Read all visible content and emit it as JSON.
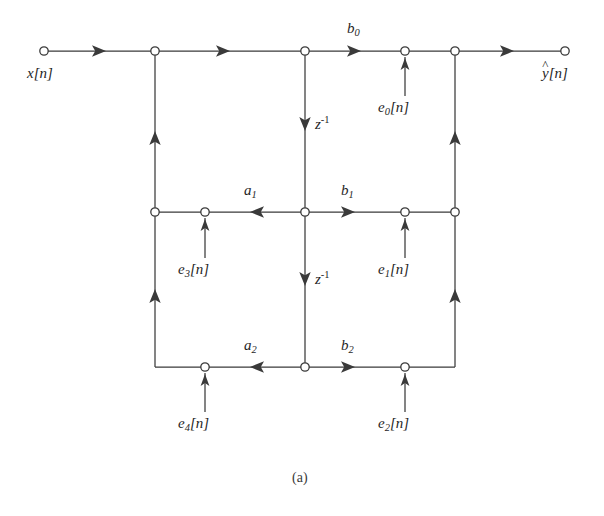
{
  "figure": {
    "caption": "(a)",
    "stroke_color": "#3a3a3a",
    "text_color": "#1f1f1f",
    "background_color": "#ffffff"
  },
  "labels": {
    "input": {
      "base": "x",
      "bracket": "[n]"
    },
    "output": {
      "hat": "^",
      "base": "y",
      "bracket": "[n]"
    },
    "b0": {
      "base": "b",
      "sub": "0"
    },
    "b1": {
      "base": "b",
      "sub": "1"
    },
    "b2": {
      "base": "b",
      "sub": "2"
    },
    "a1": {
      "base": "a",
      "sub": "1"
    },
    "a2": {
      "base": "a",
      "sub": "2"
    },
    "delay1": {
      "base": "z",
      "sup": "-1"
    },
    "delay2": {
      "base": "z",
      "sup": "-1"
    },
    "e0": {
      "base": "e",
      "sub": "0",
      "bracket": "[n]"
    },
    "e1": {
      "base": "e",
      "sub": "1",
      "bracket": "[n]"
    },
    "e2": {
      "base": "e",
      "sub": "2",
      "bracket": "[n]"
    },
    "e3": {
      "base": "e",
      "sub": "3",
      "bracket": "[n]"
    },
    "e4": {
      "base": "e",
      "sub": "4",
      "bracket": "[n]"
    }
  },
  "graph": {
    "rows": {
      "top_y": 51,
      "middle_y": 212,
      "bottom_y": 367
    },
    "columns": {
      "input_x": 44,
      "left_x": 155,
      "e34_x": 205,
      "center_x": 305,
      "e012_x": 405,
      "right_x": 455,
      "output_x": 565
    },
    "nodes": [
      {
        "name": "node-input",
        "x": 44,
        "y": 51
      },
      {
        "name": "node-top-left",
        "x": 155,
        "y": 51
      },
      {
        "name": "node-top-center",
        "x": 305,
        "y": 51
      },
      {
        "name": "node-top-e0",
        "x": 405,
        "y": 51
      },
      {
        "name": "node-top-right",
        "x": 455,
        "y": 51
      },
      {
        "name": "node-output",
        "x": 565,
        "y": 51
      },
      {
        "name": "node-mid-left",
        "x": 155,
        "y": 212
      },
      {
        "name": "node-mid-e3",
        "x": 205,
        "y": 212
      },
      {
        "name": "node-mid-center",
        "x": 305,
        "y": 212
      },
      {
        "name": "node-mid-e1",
        "x": 405,
        "y": 212
      },
      {
        "name": "node-mid-right",
        "x": 455,
        "y": 212
      },
      {
        "name": "node-bot-e4",
        "x": 205,
        "y": 367
      },
      {
        "name": "node-bot-center",
        "x": 305,
        "y": 367
      },
      {
        "name": "node-bot-e2",
        "x": 405,
        "y": 367
      }
    ],
    "edges": [
      {
        "name": "edge-input-to-left",
        "dir": "right"
      },
      {
        "name": "edge-left-to-center-top",
        "dir": "right"
      },
      {
        "name": "edge-center-to-e0",
        "dir": "right",
        "gain": "b0"
      },
      {
        "name": "edge-e0-to-right-top",
        "dir": "right"
      },
      {
        "name": "edge-right-to-output",
        "dir": "right"
      },
      {
        "name": "edge-delay-1",
        "dir": "down",
        "gain": "z^-1"
      },
      {
        "name": "edge-delay-2",
        "dir": "down",
        "gain": "z^-1"
      },
      {
        "name": "edge-mid-center-to-e3",
        "dir": "left",
        "gain": "a1"
      },
      {
        "name": "edge-mid-e3-to-left",
        "dir": "left"
      },
      {
        "name": "edge-mid-center-to-e1",
        "dir": "right",
        "gain": "b1"
      },
      {
        "name": "edge-mid-e1-to-right",
        "dir": "right"
      },
      {
        "name": "edge-bot-center-to-e4",
        "dir": "left",
        "gain": "a2"
      },
      {
        "name": "edge-bot-center-to-e2",
        "dir": "right",
        "gain": "b2"
      },
      {
        "name": "edge-left-vertical-lower",
        "dir": "up"
      },
      {
        "name": "edge-left-vertical-upper",
        "dir": "up"
      },
      {
        "name": "edge-right-vertical-lower",
        "dir": "up"
      },
      {
        "name": "edge-right-vertical-upper",
        "dir": "up"
      },
      {
        "name": "edge-noise-e0",
        "dir": "up"
      },
      {
        "name": "edge-noise-e1",
        "dir": "up"
      },
      {
        "name": "edge-noise-e2",
        "dir": "up"
      },
      {
        "name": "edge-noise-e3",
        "dir": "up"
      },
      {
        "name": "edge-noise-e4",
        "dir": "up"
      }
    ]
  }
}
